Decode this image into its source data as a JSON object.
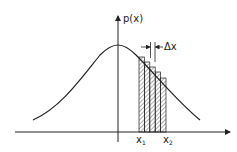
{
  "diagram": {
    "y_axis_label": "p(x)",
    "x_axis_label": "",
    "interval_label": "Δx",
    "x1_label": "x",
    "x1_sub": "1",
    "x2_label": "x",
    "x2_sub": "2",
    "num_bars": 5,
    "colors": {
      "line": "#222222",
      "hatch": "#333333",
      "background": "#ffffff"
    }
  }
}
